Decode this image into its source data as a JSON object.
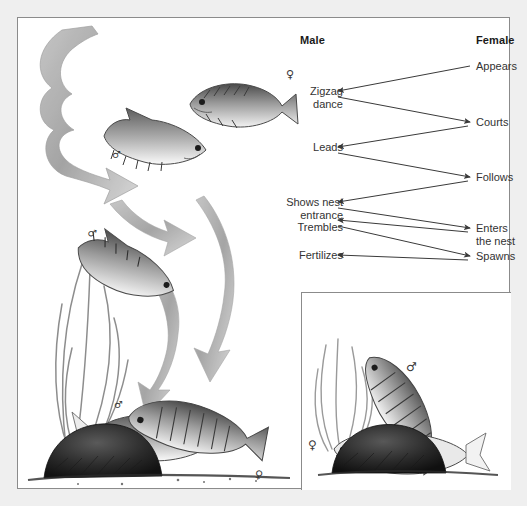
{
  "figure": {
    "caption_absent": true,
    "panel_border_color": "#8b8b8b",
    "background_color": "#efefef",
    "panel_background": "#ffffff"
  },
  "ladder": {
    "columns": {
      "male_header": "Male",
      "female_header": "Female"
    },
    "male_steps": [
      {
        "id": "zigzag",
        "label": "Zigzag\ndance",
        "line1": "Zigzag",
        "line2": "dance"
      },
      {
        "id": "leads",
        "label": "Leads",
        "line1": "Leads",
        "line2": ""
      },
      {
        "id": "shows-nest",
        "label": "Shows nest\nentrance",
        "line1": "Shows nest",
        "line2": "entrance"
      },
      {
        "id": "trembles",
        "label": "Trembles",
        "line1": "Trembles",
        "line2": ""
      },
      {
        "id": "fertilizes",
        "label": "Fertilizes",
        "line1": "Fertilizes",
        "line2": ""
      }
    ],
    "female_steps": [
      {
        "id": "appears",
        "label": "Appears",
        "line1": "Appears",
        "line2": ""
      },
      {
        "id": "courts",
        "label": "Courts",
        "line1": "Courts",
        "line2": ""
      },
      {
        "id": "follows",
        "label": "Follows",
        "line1": "Follows",
        "line2": ""
      },
      {
        "id": "enters",
        "label": "Enters\nthe nest",
        "line1": "Enters",
        "line2": "the nest"
      },
      {
        "id": "spawns",
        "label": "Spawns",
        "line1": "Spawns",
        "line2": ""
      }
    ],
    "arrow_sequence": [
      {
        "from": "appears",
        "to": "zigzag"
      },
      {
        "from": "zigzag",
        "to": "courts"
      },
      {
        "from": "courts",
        "to": "leads"
      },
      {
        "from": "leads",
        "to": "follows"
      },
      {
        "from": "follows",
        "to": "shows-nest"
      },
      {
        "from": "shows-nest",
        "to": "enters"
      },
      {
        "from": "enters",
        "to": "trembles"
      },
      {
        "from": "trembles",
        "to": "spawns"
      },
      {
        "from": "spawns",
        "to": "fertilizes"
      }
    ],
    "arrow_color": "#444444"
  },
  "illustration": {
    "title_absent": true,
    "scene": "stickleback courtship sequence",
    "symbols": [
      {
        "name": "male-symbol",
        "glyph": "♂"
      },
      {
        "name": "female-symbol",
        "glyph": "♀"
      }
    ],
    "elements": [
      "swooping-arrows",
      "water-plants",
      "nest-mound",
      "sea-floor",
      "fish"
    ]
  },
  "inset": {
    "scene": "female entering nest while male shows entrance",
    "symbols": [
      {
        "name": "female-symbol",
        "glyph": "♀"
      },
      {
        "name": "male-symbol",
        "glyph": "♂"
      }
    ]
  }
}
